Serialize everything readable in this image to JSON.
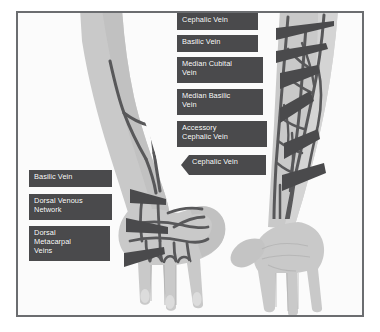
{
  "figure": {
    "border_color": "#6b6d70",
    "background_color": "#fbfbfb",
    "label_box_color": "#4a4a4c",
    "label_text_color": "#ffffff",
    "skin_color": "#c9c9c9",
    "skin_shadow_color": "#b3b3b3",
    "vein_color": "#58585a"
  },
  "labels": {
    "right_side": [
      {
        "id": "cephalic-vein-upper",
        "text": "Cephalic Vein"
      },
      {
        "id": "basilic-vein-upper",
        "text": "Basilic Vein"
      },
      {
        "id": "median-cubital-vein",
        "text": "Median Cubital\nVein"
      },
      {
        "id": "median-basilic-vein",
        "text": "Median Basilic\nVein"
      },
      {
        "id": "accessory-cephalic-vein",
        "text": "Accessory\nCephalic Vein"
      },
      {
        "id": "cephalic-vein-lower",
        "text": "Cephalic Vein"
      }
    ],
    "left_side": [
      {
        "id": "basilic-vein-forearm",
        "text": "Basilic Vein"
      },
      {
        "id": "dorsal-venous-network",
        "text": "Dorsal Venous\nNetwork"
      },
      {
        "id": "dorsal-metacarpal-veins",
        "text": "Dorsal\nMetacarpal\nVeins"
      }
    ]
  },
  "anatomy": {
    "left_limb": {
      "name": "left-forearm-dorsal-view",
      "hand_view": "dorsal"
    },
    "right_limb": {
      "name": "right-forearm-anterior-view",
      "hand_view": "palmar"
    }
  }
}
